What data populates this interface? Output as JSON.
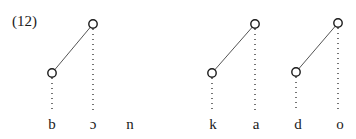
{
  "example_number": "(12)",
  "segments": [
    {
      "text": "b",
      "x": 52
    },
    {
      "text": "ɔ",
      "x": 93
    },
    {
      "text": "n",
      "x": 130
    },
    {
      "text": "k",
      "x": 213
    },
    {
      "text": "a",
      "x": 256
    },
    {
      "text": "d",
      "x": 298
    },
    {
      "text": "o",
      "x": 340
    }
  ],
  "tone_nodes": [
    {
      "low": {
        "x": 52,
        "y": 73
      },
      "high": {
        "x": 93,
        "y": 24
      }
    },
    {
      "low": {
        "x": 212,
        "y": 73
      },
      "high": {
        "x": 255,
        "y": 24
      }
    },
    {
      "low": {
        "x": 296,
        "y": 72
      },
      "high": {
        "x": 338,
        "y": 23
      }
    }
  ],
  "colors": {
    "ink": "#1a1a1a",
    "line": "#555555"
  }
}
